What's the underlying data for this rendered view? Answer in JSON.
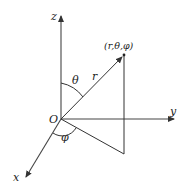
{
  "diagram": {
    "origin": {
      "label": "O",
      "x": 61,
      "y": 119
    },
    "axes": [
      {
        "name": "z",
        "label": "z",
        "end": [
          61,
          14
        ],
        "label_pos": [
          51,
          20
        ]
      },
      {
        "name": "y",
        "label": "y",
        "end": [
          176,
          119
        ],
        "label_pos": [
          170,
          115
        ]
      },
      {
        "name": "x",
        "label": "x",
        "end": [
          25,
          179
        ],
        "label_pos": [
          13,
          181
        ]
      }
    ],
    "point": {
      "label": "(r,θ,φ)",
      "x": 124,
      "y": 55,
      "label_pos": [
        104,
        49
      ]
    },
    "radius_label": {
      "text": "r",
      "pos": [
        92,
        80
      ]
    },
    "projection_foot": {
      "x": 124,
      "y": 154
    },
    "angles": [
      {
        "name": "theta",
        "label": "θ",
        "label_pos": [
          72,
          84
        ]
      },
      {
        "name": "phi",
        "label": "φ",
        "label_pos": [
          61,
          139
        ]
      }
    ],
    "colors": {
      "stroke": "#333333",
      "text": "#222222",
      "background": "#ffffff"
    }
  }
}
